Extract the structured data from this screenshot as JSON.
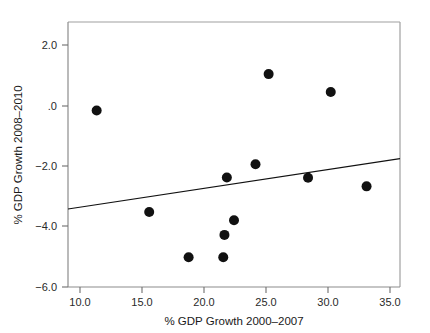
{
  "chart_data": {
    "type": "scatter",
    "title": "",
    "xlabel": "% GDP Growth 2000–2007",
    "ylabel": "% GDP Growth 2008–2010",
    "xlim": [
      8.4,
      36.2
    ],
    "ylim": [
      -6.0,
      2.9
    ],
    "grid": false,
    "legend": null,
    "xticks": [
      10.0,
      15.0,
      20.0,
      25.0,
      30.0,
      35.0
    ],
    "xtick_labels": [
      "10.0",
      "15.0",
      "20.0",
      "25.0",
      "30.0",
      "35.0"
    ],
    "yticks": [
      2.0,
      0.0,
      -2.0,
      -4.0,
      -6.0
    ],
    "ytick_labels": [
      "2.0",
      ".0",
      "−2.0",
      "−4.0",
      "−6.0"
    ],
    "marker": "filled-circle",
    "marker_color": "#111111",
    "marker_size": 5,
    "points": [
      {
        "x": 10.8,
        "y": -0.07
      },
      {
        "x": 15.2,
        "y": -3.48
      },
      {
        "x": 18.5,
        "y": -5.0
      },
      {
        "x": 21.4,
        "y": -5.0
      },
      {
        "x": 21.5,
        "y": -4.25
      },
      {
        "x": 21.7,
        "y": -2.32
      },
      {
        "x": 22.3,
        "y": -3.76
      },
      {
        "x": 24.1,
        "y": -1.88
      },
      {
        "x": 25.2,
        "y": 1.15
      },
      {
        "x": 28.5,
        "y": -2.33
      },
      {
        "x": 30.4,
        "y": 0.55
      },
      {
        "x": 33.4,
        "y": -2.62
      }
    ],
    "series": [
      {
        "name": "Countries",
        "x": [
          10.8,
          15.2,
          18.5,
          21.4,
          21.5,
          21.7,
          22.3,
          24.1,
          25.2,
          28.5,
          30.4,
          33.4
        ],
        "values": [
          -0.07,
          -3.48,
          -5.0,
          -5.0,
          -4.25,
          -2.32,
          -3.76,
          -1.88,
          1.15,
          -2.33,
          0.55,
          -2.62
        ]
      }
    ],
    "fit_line": {
      "type": "linear-regression",
      "color": "#111111",
      "x_start": 8.4,
      "y_start": -3.38,
      "x_end": 36.2,
      "y_end": -1.69,
      "slope": 0.0608,
      "intercept": -3.891
    }
  },
  "axes": {
    "x_title": "% GDP Growth 2000–2007",
    "y_title": "% GDP Growth 2008–2010"
  }
}
